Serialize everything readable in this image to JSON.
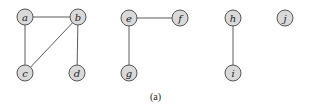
{
  "figure": {
    "caption": "(a)",
    "node_radius": 8,
    "colors": {
      "node_fill": "#d9d9d9",
      "node_stroke": "#555555",
      "edge": "#5a5a5a"
    },
    "nodes": [
      {
        "id": "a",
        "label": "a",
        "x": 25,
        "y": 17
      },
      {
        "id": "b",
        "label": "b",
        "x": 78,
        "y": 17
      },
      {
        "id": "c",
        "label": "c",
        "x": 25,
        "y": 73
      },
      {
        "id": "d",
        "label": "d",
        "x": 77,
        "y": 73
      },
      {
        "id": "e",
        "label": "e",
        "x": 129,
        "y": 18
      },
      {
        "id": "f",
        "label": "f",
        "x": 180,
        "y": 18
      },
      {
        "id": "g",
        "label": "g",
        "x": 129,
        "y": 73
      },
      {
        "id": "h",
        "label": "h",
        "x": 233,
        "y": 18
      },
      {
        "id": "i",
        "label": "i",
        "x": 233,
        "y": 73
      },
      {
        "id": "j",
        "label": "j",
        "x": 285,
        "y": 18
      }
    ],
    "edges": [
      {
        "from": "a",
        "to": "b"
      },
      {
        "from": "a",
        "to": "c"
      },
      {
        "from": "b",
        "to": "c"
      },
      {
        "from": "b",
        "to": "d"
      },
      {
        "from": "e",
        "to": "f"
      },
      {
        "from": "e",
        "to": "g"
      },
      {
        "from": "h",
        "to": "i"
      }
    ]
  }
}
